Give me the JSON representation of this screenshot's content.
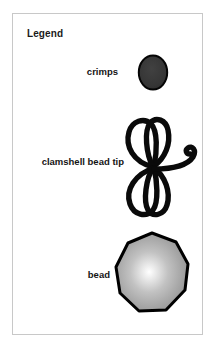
{
  "panel": {
    "title": "Legend",
    "border_color": "#c8c8c8",
    "background_color": "#ffffff"
  },
  "entries": [
    {
      "label": "crimps",
      "icon_name": "crimp-bead-icon",
      "shape": "ellipse",
      "fill_color": "#353535",
      "stroke_color": "#000000"
    },
    {
      "label": "clamshell bead tip",
      "icon_name": "clamshell-bead-tip-icon",
      "shape": "double-loop-with-hook",
      "fill_color": "none",
      "stroke_color": "#0a0a0a"
    },
    {
      "label": "bead",
      "icon_name": "round-bead-icon",
      "shape": "polygon-nonagon",
      "fill_color": "#a8a8a8",
      "highlight_color": "#ffffff",
      "stroke_color": "#000000"
    }
  ]
}
